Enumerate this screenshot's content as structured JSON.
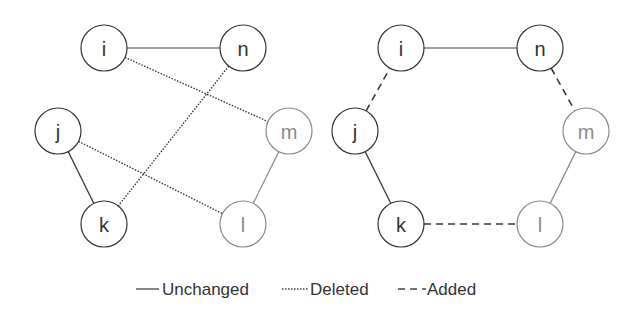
{
  "diagram": {
    "graphs": [
      {
        "name": "before",
        "nodes": [
          {
            "id": "i",
            "label": "i",
            "x": 104,
            "y": 48,
            "color": "#333333"
          },
          {
            "id": "n",
            "label": "n",
            "x": 243,
            "y": 48,
            "color": "#333333"
          },
          {
            "id": "j",
            "label": "j",
            "x": 58,
            "y": 131,
            "color": "#333333"
          },
          {
            "id": "m",
            "label": "m",
            "x": 289,
            "y": 131,
            "color": "#8a8a8a"
          },
          {
            "id": "k",
            "label": "k",
            "x": 104,
            "y": 224,
            "color": "#333333"
          },
          {
            "id": "l",
            "label": "l",
            "x": 243,
            "y": 224,
            "color": "#8a8a8a"
          }
        ],
        "edges": [
          {
            "from": "i",
            "to": "n",
            "type": "unchanged"
          },
          {
            "from": "j",
            "to": "k",
            "type": "unchanged"
          },
          {
            "from": "m",
            "to": "l",
            "type": "unchanged",
            "color": "#8a8a8a"
          },
          {
            "from": "i",
            "to": "m",
            "type": "deleted"
          },
          {
            "from": "n",
            "to": "k",
            "type": "deleted"
          },
          {
            "from": "j",
            "to": "l",
            "type": "deleted"
          }
        ]
      },
      {
        "name": "after",
        "nodes": [
          {
            "id": "i",
            "label": "i",
            "x": 401,
            "y": 48,
            "color": "#333333"
          },
          {
            "id": "n",
            "label": "n",
            "x": 540,
            "y": 48,
            "color": "#333333"
          },
          {
            "id": "j",
            "label": "j",
            "x": 355,
            "y": 131,
            "color": "#333333"
          },
          {
            "id": "m",
            "label": "m",
            "x": 586,
            "y": 131,
            "color": "#8a8a8a"
          },
          {
            "id": "k",
            "label": "k",
            "x": 401,
            "y": 224,
            "color": "#333333"
          },
          {
            "id": "l",
            "label": "l",
            "x": 540,
            "y": 224,
            "color": "#8a8a8a"
          }
        ],
        "edges": [
          {
            "from": "i",
            "to": "n",
            "type": "unchanged"
          },
          {
            "from": "j",
            "to": "k",
            "type": "unchanged"
          },
          {
            "from": "m",
            "to": "l",
            "type": "unchanged",
            "color": "#8a8a8a"
          },
          {
            "from": "j",
            "to": "i",
            "type": "added"
          },
          {
            "from": "n",
            "to": "m",
            "type": "added"
          },
          {
            "from": "k",
            "to": "l",
            "type": "added"
          }
        ]
      }
    ],
    "node_radius": 23,
    "legend": [
      {
        "type": "unchanged",
        "label": "Unchanged"
      },
      {
        "type": "deleted",
        "label": "Deleted"
      },
      {
        "type": "added",
        "label": "Added"
      }
    ]
  }
}
